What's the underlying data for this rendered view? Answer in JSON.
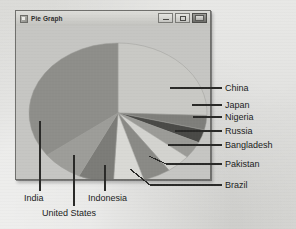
{
  "window": {
    "title": "Pie Graph",
    "icon": "app-window-icon",
    "controls": [
      {
        "name": "minimize-button",
        "glyph": "minimize-icon"
      },
      {
        "name": "maximize-button",
        "glyph": "maximize-icon"
      },
      {
        "name": "close-button",
        "glyph": "close-icon"
      }
    ]
  },
  "chart_data": {
    "type": "pie",
    "title": "Pie Graph",
    "xlabel": "",
    "ylabel": "",
    "legend_position": "callout-labels",
    "grid": false,
    "categories": [
      "China",
      "Japan",
      "Nigeria",
      "Russia",
      "Bangladesh",
      "Pakistan",
      "Brazil",
      "Indonesia",
      "United States",
      "India"
    ],
    "values": [
      25.5,
      3.5,
      3.0,
      4.0,
      4.5,
      5.0,
      5.5,
      6.5,
      7.5,
      35.0
    ],
    "labels": [
      "China",
      "Japan",
      "Nigeria",
      "Russia",
      "Bangladesh",
      "Pakistan",
      "Brazil",
      "Indonesia",
      "United States",
      "India"
    ],
    "colors": [
      "#c9c9c5",
      "#7f7f7b",
      "#4a4a47",
      "#9b9b97",
      "#d3d3cf",
      "#8a8a86",
      "#d9d9d5",
      "#7c7c78",
      "#9d9d99",
      "#8e8e8a"
    ],
    "slices": [
      {
        "label": "China",
        "value": 25.5,
        "color": "#c9c9c5",
        "start_deg": -90,
        "end_deg": 2
      },
      {
        "label": "Japan",
        "value": 3.5,
        "color": "#7f7f7b",
        "start_deg": 2,
        "end_deg": 14
      },
      {
        "label": "Nigeria",
        "value": 3.0,
        "color": "#4a4a47",
        "start_deg": 14,
        "end_deg": 25
      },
      {
        "label": "Russia",
        "value": 4.0,
        "color": "#9b9b97",
        "start_deg": 25,
        "end_deg": 39
      },
      {
        "label": "Bangladesh",
        "value": 4.5,
        "color": "#d3d3cf",
        "start_deg": 39,
        "end_deg": 55
      },
      {
        "label": "Pakistan",
        "value": 5.0,
        "color": "#8a8a86",
        "start_deg": 55,
        "end_deg": 73
      },
      {
        "label": "Brazil",
        "value": 5.5,
        "color": "#d9d9d5",
        "start_deg": 73,
        "end_deg": 93
      },
      {
        "label": "Indonesia",
        "value": 6.5,
        "color": "#7c7c78",
        "start_deg": 93,
        "end_deg": 116
      },
      {
        "label": "United States",
        "value": 7.5,
        "color": "#9d9d99",
        "start_deg": 116,
        "end_deg": 143
      },
      {
        "label": "India",
        "value": 35.0,
        "color": "#8e8e8a",
        "start_deg": 143,
        "end_deg": 270
      }
    ]
  },
  "callouts": {
    "right": [
      {
        "name": "callout-china",
        "label": "China"
      },
      {
        "name": "callout-japan",
        "label": "Japan"
      },
      {
        "name": "callout-nigeria",
        "label": "Nigeria"
      },
      {
        "name": "callout-russia",
        "label": "Russia"
      },
      {
        "name": "callout-bangladesh",
        "label": "Bangladesh"
      },
      {
        "name": "callout-pakistan",
        "label": "Pakistan"
      },
      {
        "name": "callout-brazil",
        "label": "Brazil"
      }
    ],
    "bottom": [
      {
        "name": "callout-india",
        "label": "India"
      },
      {
        "name": "callout-united-states",
        "label": "United States"
      },
      {
        "name": "callout-indonesia",
        "label": "Indonesia"
      }
    ]
  },
  "colors": {
    "page_background": "#d6d6d4",
    "window_face": "#c9c9c6",
    "window_border": "#6f6f6c",
    "plot_area": "#c6c6c3",
    "leader_line": "#2a2a28",
    "text": "#1b1b1b"
  }
}
